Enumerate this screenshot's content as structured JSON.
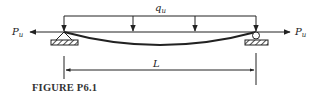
{
  "diagram": {
    "type": "beam-column loading diagram",
    "distributed_load": {
      "label": "q",
      "subscript": "u",
      "arrow_count": 4
    },
    "axial_load_left": {
      "label": "P",
      "subscript": "u",
      "direction": "left"
    },
    "axial_load_right": {
      "label": "P",
      "subscript": "u",
      "direction": "right"
    },
    "supports": {
      "left": "pin",
      "right": "roller"
    },
    "span": {
      "label": "L"
    },
    "deflected_shape": "sagging curve"
  },
  "caption": "FIGURE P6.1"
}
